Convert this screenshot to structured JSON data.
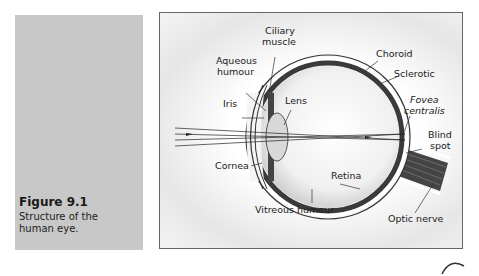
{
  "caption": {
    "figure_number": "Figure 9.1",
    "text_line1": "Structure of the",
    "text_line2": "human eye."
  },
  "diagram": {
    "title": "Structure of the human eye",
    "labels": {
      "ciliary_muscle_1": "Ciliary",
      "ciliary_muscle_2": "muscle",
      "aqueous_humour_1": "Aqueous",
      "aqueous_humour_2": "humour",
      "iris": "Iris",
      "lens": "Lens",
      "cornea": "Cornea",
      "choroid": "Choroid",
      "sclerotic": "Sclerotic",
      "fovea_1": "Fovea",
      "fovea_2": "centralis",
      "blind_spot_1": "Blind",
      "blind_spot_2": "spot",
      "retina": "Retina",
      "vitreous_humour": "Vitreous humour",
      "optic_nerve": "Optic nerve"
    }
  },
  "colors": {
    "panel_gray": "#c8c8c8",
    "border": "#666666",
    "choroid": "#3a3a3a"
  }
}
